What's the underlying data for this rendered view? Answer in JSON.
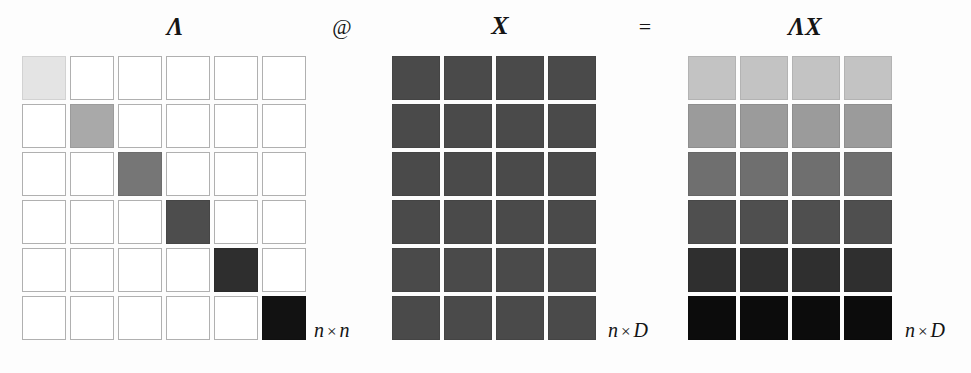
{
  "figure": {
    "caption_symbols": {
      "lambda": "Λ",
      "matmul_operator": "@",
      "x": "X",
      "equals": "=",
      "lambda_x": "ΛX"
    }
  },
  "operands": {
    "lambda": {
      "name": "Λ",
      "shape_label": {
        "rows": "n",
        "times": "×",
        "cols": "n"
      },
      "rows": 6,
      "cols": 6,
      "kind": "diagonal",
      "diagonal_colors": [
        "#e4e4e4",
        "#a9a9a9",
        "#767676",
        "#4d4d4d",
        "#2e2e2e",
        "#121212"
      ],
      "empty_color": "#ffffff",
      "empty_border": "#b0b0b0"
    },
    "x": {
      "name": "X",
      "shape_label": {
        "rows": "n",
        "times": "×",
        "cols": "D"
      },
      "rows": 6,
      "cols": 4,
      "kind": "dense-uniform",
      "fill_color": "#4a4a4a"
    },
    "result": {
      "name": "ΛX",
      "shape_label": {
        "rows": "n",
        "times": "×",
        "cols": "D"
      },
      "rows": 6,
      "cols": 4,
      "kind": "dense-row-scaled",
      "row_colors": [
        "#c3c3c3",
        "#9b9b9b",
        "#6f6f6f",
        "#4f4f4f",
        "#2f2f2f",
        "#0c0c0c"
      ]
    }
  },
  "chart_data": {
    "type": "heatmap",
    "title": "Λ @ X = ΛX",
    "panels": [
      {
        "name": "Λ",
        "shape": [
          6,
          6
        ],
        "shape_label": "n × n",
        "description": "diagonal matrix, diagonal entries shade light to dark top-left to bottom-right",
        "values": [
          [
            0.1,
            0,
            0,
            0,
            0,
            0
          ],
          [
            0,
            0.34,
            0,
            0,
            0,
            0
          ],
          [
            0,
            0,
            0.54,
            0,
            0,
            0
          ],
          [
            0,
            0,
            0,
            0.7,
            0,
            0
          ],
          [
            0,
            0,
            0,
            0,
            0.82,
            0
          ],
          [
            0,
            0,
            0,
            0,
            0,
            0.93
          ]
        ]
      },
      {
        "name": "X",
        "shape": [
          6,
          4
        ],
        "shape_label": "n × D",
        "description": "dense matrix, uniform mid-dark tone",
        "values": [
          [
            0.71,
            0.71,
            0.71,
            0.71
          ],
          [
            0.71,
            0.71,
            0.71,
            0.71
          ],
          [
            0.71,
            0.71,
            0.71,
            0.71
          ],
          [
            0.71,
            0.71,
            0.71,
            0.71
          ],
          [
            0.71,
            0.71,
            0.71,
            0.71
          ],
          [
            0.71,
            0.71,
            0.71,
            0.71
          ]
        ]
      },
      {
        "name": "ΛX",
        "shape": [
          6,
          4
        ],
        "shape_label": "n × D",
        "description": "product, each row scaled by corresponding diagonal entry of Λ",
        "values": [
          [
            0.24,
            0.24,
            0.24,
            0.24
          ],
          [
            0.39,
            0.39,
            0.39,
            0.39
          ],
          [
            0.56,
            0.56,
            0.56,
            0.56
          ],
          [
            0.69,
            0.69,
            0.69,
            0.69
          ],
          [
            0.82,
            0.82,
            0.82,
            0.82
          ],
          [
            0.95,
            0.95,
            0.95,
            0.95
          ]
        ]
      }
    ],
    "colormap": "grayscale (light = small value, dark = large value)",
    "xlabel": "",
    "ylabel": "",
    "legend": "none",
    "grid": false
  }
}
